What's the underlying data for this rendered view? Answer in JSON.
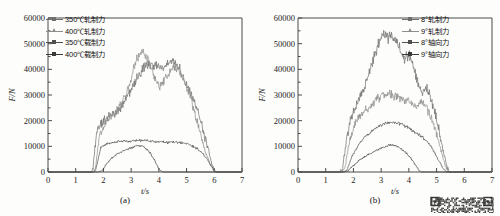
{
  "figure": {
    "background": "#fdfdfb",
    "axis_color": "#4a4a4a",
    "watermark_name": "qr-code-watermark"
  },
  "chart_data": [
    {
      "type": "line",
      "panel": "a",
      "caption": "(a)",
      "title": "",
      "xlabel": "t/s",
      "ylabel": "F/N",
      "xlim": [
        0,
        7
      ],
      "ylim": [
        0,
        60000
      ],
      "xticks": [
        0,
        1,
        2,
        3,
        4,
        5,
        6,
        7
      ],
      "xticklabels": [
        "0",
        "1",
        "2",
        "3",
        "4",
        "5",
        "6",
        "7"
      ],
      "yticks": [
        0,
        10000,
        20000,
        30000,
        40000,
        50000,
        60000
      ],
      "yticklabels": [
        "0",
        "10000",
        "20000",
        "30000",
        "40000",
        "50000",
        "60000"
      ],
      "grid": false,
      "legend_position": "upper-left",
      "series": [
        {
          "name": "350℃轧制力",
          "color": "#6e6e6e",
          "marker": "square",
          "noise": 2600,
          "x": [
            0.0,
            1.55,
            1.62,
            1.75,
            1.95,
            2.15,
            2.4,
            2.65,
            2.9,
            3.1,
            3.3,
            3.5,
            3.7,
            3.9,
            4.1,
            4.3,
            4.5,
            4.7,
            4.9,
            5.1,
            5.3,
            5.5,
            5.7,
            5.9,
            6.0,
            6.1,
            7.0
          ],
          "values": [
            0,
            0,
            900,
            15500,
            19500,
            21000,
            23000,
            25500,
            30000,
            34000,
            38000,
            41000,
            42000,
            41000,
            40500,
            42000,
            43500,
            41000,
            37000,
            32000,
            27000,
            20000,
            12000,
            4000,
            900,
            0,
            0
          ]
        },
        {
          "name": "400℃轧制力",
          "color": "#8d8d8d",
          "marker": "triangle",
          "noise": 2300,
          "x": [
            0.0,
            1.6,
            1.7,
            1.85,
            2.05,
            2.3,
            2.55,
            2.8,
            3.0,
            3.2,
            3.4,
            3.6,
            3.8,
            4.0,
            4.2,
            4.4,
            4.6,
            4.8,
            5.0,
            5.2,
            5.4,
            5.6,
            5.8,
            5.95,
            6.05,
            7.0
          ],
          "values": [
            0,
            0,
            800,
            14000,
            18500,
            21500,
            24500,
            30000,
            36000,
            44000,
            47000,
            44000,
            38000,
            33000,
            36000,
            39000,
            41000,
            38000,
            33000,
            27000,
            19000,
            11000,
            4500,
            1200,
            0,
            0
          ]
        },
        {
          "name": "350℃载制力",
          "color": "#4f4f4f",
          "marker": "square",
          "noise": 850,
          "x": [
            0.0,
            1.6,
            1.72,
            1.9,
            2.1,
            2.35,
            2.6,
            2.85,
            3.1,
            3.35,
            3.6,
            3.85,
            4.1,
            4.35,
            4.6,
            4.85,
            5.05,
            5.2,
            5.4,
            5.6,
            5.8,
            5.95,
            6.05,
            7.0
          ],
          "values": [
            0,
            0,
            600,
            9500,
            10800,
            11500,
            11800,
            12000,
            12200,
            12400,
            12200,
            11800,
            11600,
            11500,
            11600,
            11400,
            11000,
            10200,
            9000,
            7000,
            4000,
            1200,
            0,
            0
          ]
        },
        {
          "name": "400℃载制力",
          "color": "#3a3a3a",
          "marker": "square",
          "noise": 700,
          "x": [
            0.0,
            1.8,
            1.95,
            2.1,
            2.3,
            2.5,
            2.7,
            2.9,
            3.1,
            3.25,
            3.4,
            3.55,
            3.7,
            3.85,
            3.95,
            4.05,
            4.15,
            7.0
          ],
          "values": [
            0,
            0,
            500,
            3000,
            5500,
            7000,
            8200,
            9000,
            9800,
            10400,
            10100,
            9000,
            7200,
            4500,
            2200,
            600,
            0,
            0
          ]
        }
      ]
    },
    {
      "type": "line",
      "panel": "b",
      "caption": "(b)",
      "title": "",
      "xlabel": "t/s",
      "ylabel": "F/N",
      "xlim": [
        0,
        7
      ],
      "ylim": [
        0,
        60000
      ],
      "xticks": [
        0,
        1,
        2,
        3,
        4,
        5,
        6,
        7
      ],
      "xticklabels": [
        "0",
        "1",
        "2",
        "3",
        "4",
        "5",
        "6",
        "7"
      ],
      "yticks": [
        0,
        10000,
        20000,
        30000,
        40000,
        50000,
        60000
      ],
      "yticklabels": [
        "0",
        "10000",
        "20000",
        "30000",
        "40000",
        "50000",
        "60000"
      ],
      "grid": false,
      "legend_position": "upper-right",
      "series": [
        {
          "name": "8°轧制力",
          "color": "#6e6e6e",
          "marker": "square",
          "noise": 2700,
          "x": [
            0.0,
            1.5,
            1.6,
            1.75,
            1.95,
            2.15,
            2.35,
            2.55,
            2.75,
            2.95,
            3.1,
            3.25,
            3.4,
            3.55,
            3.7,
            3.85,
            4.0,
            4.15,
            4.3,
            4.45,
            4.6,
            4.75,
            4.9,
            5.05,
            5.2,
            5.35,
            5.45,
            7.0
          ],
          "values": [
            0,
            0,
            900,
            13000,
            22000,
            27000,
            32000,
            38000,
            45000,
            51000,
            54500,
            52000,
            53000,
            51000,
            47000,
            44000,
            46000,
            42000,
            36000,
            31000,
            33000,
            30000,
            25000,
            18000,
            10000,
            3000,
            0,
            0
          ]
        },
        {
          "name": "9°轧制力",
          "color": "#8d8d8d",
          "marker": "triangle",
          "noise": 2200,
          "x": [
            0.0,
            1.55,
            1.68,
            1.85,
            2.05,
            2.25,
            2.45,
            2.65,
            2.85,
            3.05,
            3.25,
            3.45,
            3.65,
            3.85,
            4.05,
            4.25,
            4.45,
            4.65,
            4.85,
            5.0,
            5.15,
            5.3,
            5.4,
            7.0
          ],
          "values": [
            0,
            0,
            800,
            11000,
            19000,
            22000,
            24000,
            26000,
            28500,
            30000,
            30500,
            30000,
            29000,
            28000,
            27000,
            26000,
            27500,
            25000,
            20000,
            15000,
            9000,
            3000,
            0,
            0
          ]
        },
        {
          "name": "8°轴向力",
          "color": "#4f4f4f",
          "marker": "square",
          "noise": 900,
          "x": [
            0.0,
            1.6,
            1.75,
            1.95,
            2.15,
            2.35,
            2.55,
            2.75,
            2.95,
            3.15,
            3.35,
            3.55,
            3.75,
            3.95,
            4.15,
            4.35,
            4.5,
            4.65,
            4.8,
            4.95,
            5.1,
            5.25,
            5.35,
            7.0
          ],
          "values": [
            0,
            0,
            500,
            6000,
            10000,
            13000,
            15000,
            16500,
            18000,
            19000,
            19300,
            19000,
            18500,
            17500,
            16000,
            14500,
            13500,
            12000,
            10000,
            7000,
            4000,
            1200,
            0,
            0
          ]
        },
        {
          "name": "9°轴向力",
          "color": "#3a3a3a",
          "marker": "square",
          "noise": 700,
          "x": [
            0.0,
            1.65,
            1.8,
            2.0,
            2.2,
            2.4,
            2.6,
            2.8,
            3.0,
            3.2,
            3.35,
            3.5,
            3.65,
            3.8,
            3.95,
            4.1,
            4.25,
            4.35,
            4.45,
            7.0
          ],
          "values": [
            0,
            0,
            400,
            2500,
            4500,
            6000,
            7200,
            8200,
            9200,
            10200,
            10500,
            10200,
            9500,
            8500,
            7000,
            5000,
            2500,
            800,
            0,
            0
          ]
        }
      ]
    }
  ]
}
